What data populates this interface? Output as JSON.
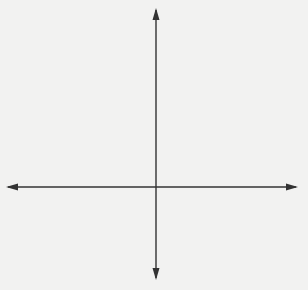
{
  "colors": {
    "background": "#f2f2f1",
    "grid": "#b5b5b5",
    "axis": "#333333",
    "point": "#333333",
    "text": "#3a3a3a"
  },
  "axes": {
    "x_label": "x",
    "y_label": "y",
    "x_ticks": [
      "-4",
      "-3",
      "-2",
      "-1",
      "0",
      "1",
      "2",
      "3",
      "4"
    ],
    "y_ticks": [
      "5",
      "4",
      "3",
      "2",
      "1",
      "0",
      "-1",
      "-2"
    ],
    "x_range": [
      -5,
      5
    ],
    "y_range": [
      -3,
      6
    ]
  },
  "points": [
    {
      "name": "A",
      "coords": "(-3, -1)",
      "x": -3,
      "y": -1
    },
    {
      "name": "B",
      "coords": "(-1, 4)",
      "x": -1,
      "y": 4
    },
    {
      "name": "C",
      "coords": "(2, 2)",
      "x": 2,
      "y": 2
    },
    {
      "name": "D",
      "coords": "(3, -1)",
      "x": 3,
      "y": -1
    }
  ]
}
